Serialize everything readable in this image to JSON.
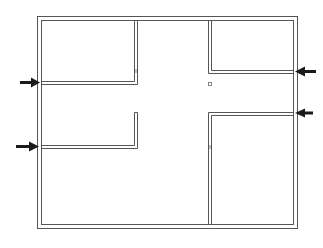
{
  "diagram": {
    "type": "floor-plan",
    "title": "",
    "colors": {
      "wall": "#555555",
      "arrow": "#1a1a1a",
      "background": "#ffffff"
    },
    "rooms": [
      {
        "id": "top-left-room",
        "label": ""
      },
      {
        "id": "top-right-room",
        "label": ""
      },
      {
        "id": "central-corridor",
        "label": ""
      },
      {
        "id": "lower-left-area",
        "label": ""
      },
      {
        "id": "bottom-right-room",
        "label": ""
      }
    ],
    "arrows": [
      {
        "id": "arrow-left-upper",
        "direction": "right",
        "side": "left"
      },
      {
        "id": "arrow-left-lower",
        "direction": "right",
        "side": "left"
      },
      {
        "id": "arrow-right-upper",
        "direction": "left",
        "side": "right"
      },
      {
        "id": "arrow-right-lower",
        "direction": "left",
        "side": "right"
      }
    ],
    "markers": [
      {
        "id": "small-square-marker",
        "shape": "square"
      }
    ]
  }
}
